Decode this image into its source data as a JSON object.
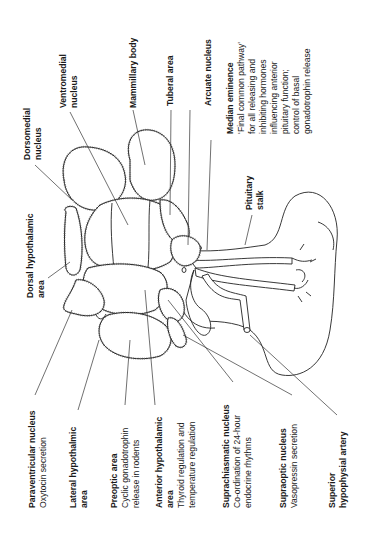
{
  "figure": {
    "orientation": "rotated-90-ccw"
  },
  "labels": {
    "dorsomedial": {
      "title": "Dorsomedial",
      "line2": "nucleus"
    },
    "ventromedial": {
      "title": "Ventromedial",
      "line2": "nucleus"
    },
    "mammillary": {
      "title": "Mammillary body"
    },
    "tuberal": {
      "title": "Tuberal area"
    },
    "arcuate": {
      "title": "Arcuate nucleus"
    },
    "median_eminence": {
      "title": "Median eminence",
      "lines": [
        "‘Final common pathway’",
        "for all releasing and",
        "inhibiting hormones",
        "influencing anterior",
        "pituitary function;",
        "control of basal",
        "gonadotrophin release"
      ]
    },
    "pituitary_stalk": {
      "title": "Pituitary",
      "line2": "stalk"
    },
    "dorsal_hypothalamic": {
      "title": "Dorsal hypothalamic",
      "line2": "area"
    },
    "paraventricular": {
      "title": "Paraventricular nucleus",
      "desc": "Oxytocin secretion"
    },
    "lateral_hypothalamic": {
      "title": "Lateral hypothalmic",
      "line2": "area"
    },
    "preoptic": {
      "title": "Preoptic area",
      "lines": [
        "Cyclic gonadotrophin",
        "release in rodents"
      ]
    },
    "anterior_hypothalamic": {
      "title": "Anterior hypothalamic",
      "line2": "area",
      "lines": [
        "Thyroid regulation and",
        "temperature regulation"
      ]
    },
    "suprachiasmatic": {
      "title": "Suprachiasmatic nucleus",
      "lines": [
        "Co-ordination of 24-hour",
        "endocrine rhythms"
      ]
    },
    "supraoptic": {
      "title": "Supraoptic nucleus",
      "desc": "Vasopressin secretion"
    },
    "superior_hypophysial": {
      "title": "Superior",
      "line2": "hypophysial artery"
    }
  },
  "colors": {
    "ink": "#1a1a1a",
    "background": "#ffffff"
  }
}
